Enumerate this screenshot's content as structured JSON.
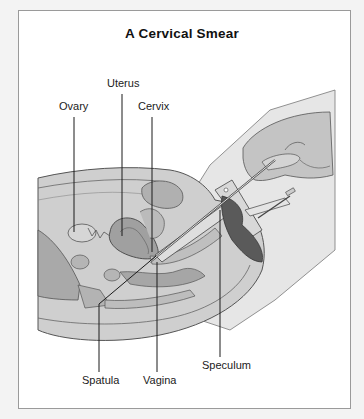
{
  "diagram": {
    "title": "A Cervical Smear",
    "labels": {
      "ovary": "Ovary",
      "uterus": "Uterus",
      "cervix": "Cervix",
      "spatula": "Spatula",
      "vagina": "Vagina",
      "speculum": "Speculum"
    },
    "colors": {
      "page_background": "#f3f3f3",
      "panel_background": "#ffffff",
      "panel_border": "#9a9a9a",
      "body_tissue": "#c9c9c9",
      "dark_tissue": "#8f8f8f",
      "light_skin": "#e2e2e2",
      "speculum_blade": "#5a5a5a",
      "leader_line": "#1a1a1a"
    }
  }
}
